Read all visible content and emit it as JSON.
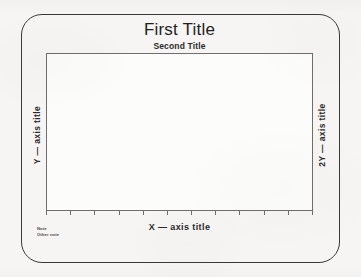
{
  "document": {
    "kind": "blank chart template",
    "background_color": "#f6f5f3",
    "ink_color": "#262626"
  },
  "card": {
    "border_color": "#3a3a3a",
    "corner_radius": 21
  },
  "titles": {
    "first": "First Title",
    "second": "Second Title"
  },
  "axes": {
    "x_title": "X — axis title",
    "y_title": "Y — axis title",
    "y2_title": "2Y — axis title"
  },
  "notes": {
    "line1": "Note",
    "line2": "Other note"
  },
  "chart_data": {
    "type": "line",
    "title": "First Title",
    "subtitle": "Second Title",
    "xlabel": "X — axis title",
    "ylabel": "Y — axis title",
    "y2label": "2Y — axis title",
    "series": [],
    "x": [],
    "values": [],
    "categories": [],
    "grid": false,
    "legend": "none",
    "annotations": [
      "Note",
      "Other note"
    ],
    "axis_frame": "full box",
    "x_tick_count": 12,
    "y_tick_count": 0,
    "xlim": null,
    "ylim": null,
    "note": "Empty plotting template — no data series are drawn inside the axes."
  }
}
